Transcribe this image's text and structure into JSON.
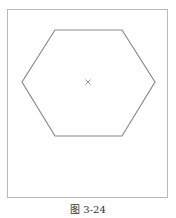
{
  "figure": {
    "caption": "图 3-24",
    "frame": {
      "x": 7,
      "y": 9,
      "width": 160,
      "height": 188,
      "stroke": "#b8b8b8"
    },
    "hexagon": {
      "points": [
        [
          22,
          82
        ],
        [
          55,
          30
        ],
        [
          122,
          30
        ],
        [
          155,
          82
        ],
        [
          122,
          136
        ],
        [
          55,
          136
        ]
      ],
      "stroke": "#8a8a8a"
    },
    "center_marker": {
      "x": 88,
      "y": 82,
      "symbol": "x-mark",
      "color": "#999999"
    }
  }
}
